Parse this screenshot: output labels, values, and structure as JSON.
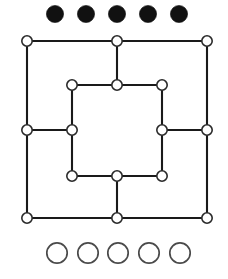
{
  "figure": {
    "name": "six-mens-morris-board",
    "background_color": "#ffffff",
    "width": 228,
    "height": 279
  },
  "board": {
    "line_color": "#1a1a1a",
    "line_width": 2.1,
    "node_fill": "#ffffff",
    "node_stroke": "#2a2a2a",
    "node_radius": 5.2,
    "point_count": 16,
    "outer_square": {
      "label": "outer ring",
      "left": 27,
      "top": 41,
      "right": 207,
      "bottom": 218
    },
    "inner_square": {
      "label": "inner ring",
      "left": 72,
      "top": 85,
      "right": 162,
      "bottom": 176
    },
    "nodes": [
      {
        "id": "outer-top-left",
        "x": 27,
        "y": 41,
        "ring": "outer",
        "position": "top-left"
      },
      {
        "id": "outer-top-middle",
        "x": 117,
        "y": 41,
        "ring": "outer",
        "position": "top-middle"
      },
      {
        "id": "outer-top-right",
        "x": 207,
        "y": 41,
        "ring": "outer",
        "position": "top-right"
      },
      {
        "id": "outer-middle-left",
        "x": 27,
        "y": 130,
        "ring": "outer",
        "position": "middle-left"
      },
      {
        "id": "outer-middle-right",
        "x": 207,
        "y": 130,
        "ring": "outer",
        "position": "middle-right"
      },
      {
        "id": "outer-bottom-left",
        "x": 27,
        "y": 218,
        "ring": "outer",
        "position": "bottom-left"
      },
      {
        "id": "outer-bottom-middle",
        "x": 117,
        "y": 218,
        "ring": "outer",
        "position": "bottom-middle"
      },
      {
        "id": "outer-bottom-right",
        "x": 207,
        "y": 218,
        "ring": "outer",
        "position": "bottom-right"
      },
      {
        "id": "inner-top-left",
        "x": 72,
        "y": 85,
        "ring": "inner",
        "position": "top-left"
      },
      {
        "id": "inner-top-middle",
        "x": 117,
        "y": 85,
        "ring": "inner",
        "position": "top-middle"
      },
      {
        "id": "inner-top-right",
        "x": 162,
        "y": 85,
        "ring": "inner",
        "position": "top-right"
      },
      {
        "id": "inner-middle-left",
        "x": 72,
        "y": 130,
        "ring": "inner",
        "position": "middle-left"
      },
      {
        "id": "inner-middle-right",
        "x": 162,
        "y": 130,
        "ring": "inner",
        "position": "middle-right"
      },
      {
        "id": "inner-bottom-left",
        "x": 72,
        "y": 176,
        "ring": "inner",
        "position": "bottom-left"
      },
      {
        "id": "inner-bottom-middle",
        "x": 117,
        "y": 176,
        "ring": "inner",
        "position": "bottom-middle"
      },
      {
        "id": "inner-bottom-right",
        "x": 162,
        "y": 176,
        "ring": "inner",
        "position": "bottom-right"
      }
    ],
    "edges": [
      {
        "from": "outer-top-left",
        "to": "outer-top-middle",
        "orientation": "horizontal"
      },
      {
        "from": "outer-top-middle",
        "to": "outer-top-right",
        "orientation": "horizontal"
      },
      {
        "from": "outer-bottom-left",
        "to": "outer-bottom-middle",
        "orientation": "horizontal"
      },
      {
        "from": "outer-bottom-middle",
        "to": "outer-bottom-right",
        "orientation": "horizontal"
      },
      {
        "from": "outer-top-left",
        "to": "outer-middle-left",
        "orientation": "vertical"
      },
      {
        "from": "outer-middle-left",
        "to": "outer-bottom-left",
        "orientation": "vertical"
      },
      {
        "from": "outer-top-right",
        "to": "outer-middle-right",
        "orientation": "vertical"
      },
      {
        "from": "outer-middle-right",
        "to": "outer-bottom-right",
        "orientation": "vertical"
      },
      {
        "from": "inner-top-left",
        "to": "inner-top-middle",
        "orientation": "horizontal"
      },
      {
        "from": "inner-top-middle",
        "to": "inner-top-right",
        "orientation": "horizontal"
      },
      {
        "from": "inner-bottom-left",
        "to": "inner-bottom-middle",
        "orientation": "horizontal"
      },
      {
        "from": "inner-bottom-middle",
        "to": "inner-bottom-right",
        "orientation": "horizontal"
      },
      {
        "from": "inner-top-left",
        "to": "inner-middle-left",
        "orientation": "vertical"
      },
      {
        "from": "inner-middle-left",
        "to": "inner-bottom-left",
        "orientation": "vertical"
      },
      {
        "from": "inner-top-right",
        "to": "inner-middle-right",
        "orientation": "vertical"
      },
      {
        "from": "inner-middle-right",
        "to": "inner-bottom-right",
        "orientation": "vertical"
      },
      {
        "from": "outer-top-middle",
        "to": "inner-top-middle",
        "orientation": "vertical",
        "type": "spoke"
      },
      {
        "from": "outer-bottom-middle",
        "to": "inner-bottom-middle",
        "orientation": "vertical",
        "type": "spoke"
      },
      {
        "from": "outer-middle-left",
        "to": "inner-middle-left",
        "orientation": "horizontal",
        "type": "spoke"
      },
      {
        "from": "outer-middle-right",
        "to": "inner-middle-right",
        "orientation": "horizontal",
        "type": "spoke"
      }
    ]
  },
  "black_pieces": {
    "label": "black pieces in hand",
    "count": 5,
    "color": "#111111",
    "radius": 8.6,
    "row_y": 14,
    "centers_x": [
      55,
      86,
      117,
      148,
      179
    ]
  },
  "white_pieces": {
    "label": "white pieces in hand",
    "count": 5,
    "fill": "#ffffff",
    "stroke": "#4a4a4a",
    "radius": 10.2,
    "row_y": 253,
    "centers_x": [
      57,
      88,
      118,
      149,
      180
    ]
  }
}
